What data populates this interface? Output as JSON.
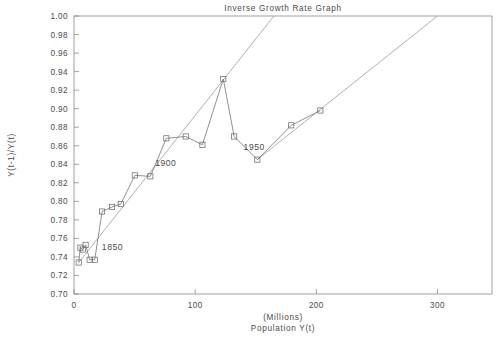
{
  "chart_data": {
    "type": "line",
    "title": "Inverse Growth Rate Graph",
    "xlabel": "Population Y(t)",
    "xlabel_units": "(Millions)",
    "ylabel": "Y(t-1)/Y(t)",
    "xlim": [
      0,
      345
    ],
    "ylim": [
      0.7,
      1.0
    ],
    "grid": false,
    "legend": "none",
    "xticks": [
      0,
      100,
      200,
      300
    ],
    "xticklabels": [
      "0",
      "100",
      "200",
      "300"
    ],
    "yticks": [
      0.7,
      0.72,
      0.74,
      0.76,
      0.78,
      0.8,
      0.82,
      0.84,
      0.86,
      0.88,
      0.9,
      0.92,
      0.94,
      0.96,
      0.98,
      1.0
    ],
    "yticklabels": [
      "0.70",
      "0.72",
      "0.74",
      "0.76",
      "0.78",
      "0.80",
      "0.82",
      "0.84",
      "0.86",
      "0.88",
      "0.90",
      "0.92",
      "0.94",
      "0.96",
      "0.98",
      "1.00"
    ],
    "series": [
      {
        "name": "Inverse growth rate",
        "marker": "square",
        "x": [
          3.9,
          5.3,
          7.2,
          9.6,
          12.9,
          17.1,
          23.2,
          31.4,
          38.6,
          50.2,
          63.0,
          76.2,
          92.2,
          106.0,
          123.2,
          132.2,
          151.3,
          179.3,
          203.3
        ],
        "y": [
          0.734,
          0.75,
          0.748,
          0.753,
          0.737,
          0.737,
          0.789,
          0.794,
          0.797,
          0.828,
          0.827,
          0.868,
          0.87,
          0.861,
          0.932,
          0.87,
          0.845,
          0.882,
          0.898
        ]
      }
    ],
    "trend_lines": [
      {
        "name": "trend-upper-left",
        "x": [
          3.9,
          165.0
        ],
        "y": [
          0.734,
          1.0
        ]
      },
      {
        "name": "trend-lower-right",
        "x": [
          151.3,
          300.0
        ],
        "y": [
          0.845,
          1.0
        ]
      }
    ],
    "annotations": [
      {
        "text": "1850",
        "x": 23.0,
        "y": 0.748
      },
      {
        "text": "1900",
        "x": 67.0,
        "y": 0.838
      },
      {
        "text": "1950",
        "x": 140.0,
        "y": 0.855
      }
    ]
  }
}
